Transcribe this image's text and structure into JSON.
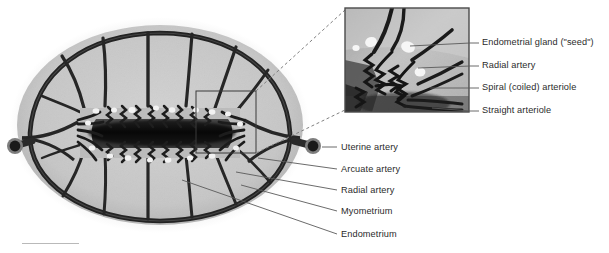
{
  "figure": {
    "type": "anatomical-illustration",
    "style": "grayscale halftone medical illustration"
  },
  "colors": {
    "background": "#ffffff",
    "serosa_halo": "#e3e3e3",
    "myometrium": "#c9c9c9",
    "myometrium_dark": "#b2b2b2",
    "endometrium": "#bdbdbd",
    "cavity_dark": "#1d1d1d",
    "vessel": "#2a2a2a",
    "gland_white": "#f4f4f4",
    "label_text": "#2b2b2b",
    "leader_line": "#555555",
    "inset_border": "#4a4a4a",
    "dashed_connector": "#777777",
    "scalebar": "#b9b9b9"
  },
  "inset": {
    "name": "magnified-endometrium-inset",
    "box_on_main": {
      "x": 196,
      "y": 91,
      "width": 60,
      "height": 62
    },
    "frame": {
      "x": 345,
      "y": 8,
      "width": 124,
      "height": 104
    },
    "labels": [
      {
        "id": "endometrial-gland",
        "text": "Endometrial gland (\"seed\")",
        "x": 482,
        "y": 43,
        "leader_from_x": 470,
        "leader_to_x": 478,
        "target_x": 412,
        "target_y": 46
      },
      {
        "id": "radial-artery-inset",
        "text": "Radial artery",
        "x": 482,
        "y": 66,
        "leader_from_x": 470,
        "leader_to_x": 478,
        "target_x": 420,
        "target_y": 68
      },
      {
        "id": "spiral-coiled-arteriole",
        "text": "Spiral (coiled) arteriole",
        "x": 482,
        "y": 88,
        "leader_from_x": 470,
        "leader_to_x": 478,
        "target_x": 428,
        "target_y": 89
      },
      {
        "id": "straight-arteriole",
        "text": "Straight arteriole",
        "x": 482,
        "y": 111,
        "leader_from_x": 470,
        "leader_to_x": 478,
        "target_x": 430,
        "target_y": 110
      }
    ]
  },
  "main_labels": [
    {
      "id": "uterine-artery",
      "text": "Uterine artery",
      "x": 340,
      "y": 148,
      "leader_from_x": 322,
      "leader_from_y": 147,
      "leader_to_x": 336,
      "leader_to_y": 147
    },
    {
      "id": "arcuate-artery",
      "text": "Arcuate artery",
      "x": 340,
      "y": 170,
      "leader_from_x": 262,
      "leader_from_y": 160,
      "leader_to_x": 336,
      "leader_to_y": 169
    },
    {
      "id": "radial-artery-main",
      "text": "Radial artery",
      "x": 340,
      "y": 191,
      "leader_from_x": 238,
      "leader_from_y": 173,
      "leader_to_x": 336,
      "leader_to_y": 190
    },
    {
      "id": "myometrium",
      "text": "Myometrium",
      "x": 340,
      "y": 212,
      "leader_from_x": 243,
      "leader_from_y": 186,
      "leader_to_x": 336,
      "leader_to_y": 211
    },
    {
      "id": "endometrium",
      "text": "Endometrium",
      "x": 340,
      "y": 235,
      "leader_from_x": 185,
      "leader_from_y": 180,
      "leader_to_x": 336,
      "leader_to_y": 234
    }
  ],
  "structures": {
    "uterus_body": {
      "cx": 160,
      "cy": 125,
      "rx": 148,
      "ry": 105
    },
    "left_uterine_artery_ring": {
      "cx": 15,
      "cy": 146,
      "r": 8
    },
    "right_uterine_artery_ring": {
      "cx": 313,
      "cy": 146,
      "r": 8
    },
    "endometrial_cavity": {
      "x": 95,
      "y": 118,
      "width": 130,
      "height": 30
    }
  }
}
